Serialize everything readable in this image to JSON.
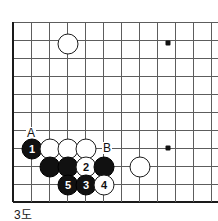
{
  "figure": {
    "caption": "3도",
    "kind": "go-board-diagram"
  },
  "board": {
    "grid": {
      "origin_x": 13,
      "origin_y": 22,
      "spacing": 18,
      "cols": 12,
      "rows": 11,
      "line_color": "#5d5d5d",
      "edge_color": "#1a1a1a",
      "background": "#ffffff"
    },
    "edges": {
      "left": true,
      "bottom": true,
      "top": false,
      "right": false
    },
    "star_points": [
      {
        "name": "star-point-upper-right",
        "x": 168,
        "y": 43
      },
      {
        "name": "star-point-lower-right",
        "x": 168,
        "y": 148
      }
    ],
    "stones": [
      {
        "id": "white-upper-left-approach",
        "color": "white",
        "label": "",
        "x": 67,
        "y": 43
      },
      {
        "id": "black-move-1",
        "color": "black",
        "label": "1",
        "x": 31,
        "y": 148
      },
      {
        "id": "white-a",
        "color": "white",
        "label": "",
        "x": 49,
        "y": 148
      },
      {
        "id": "white-b",
        "color": "white",
        "label": "",
        "x": 67,
        "y": 148
      },
      {
        "id": "white-c",
        "color": "white",
        "label": "",
        "x": 85,
        "y": 148
      },
      {
        "id": "black-d",
        "color": "black",
        "label": "",
        "x": 49,
        "y": 166
      },
      {
        "id": "black-e",
        "color": "black",
        "label": "",
        "x": 67,
        "y": 166
      },
      {
        "id": "white-move-2",
        "color": "white",
        "label": "2",
        "x": 85,
        "y": 166
      },
      {
        "id": "black-f",
        "color": "black",
        "label": "",
        "x": 103,
        "y": 166
      },
      {
        "id": "white-right-side",
        "color": "white",
        "label": "",
        "x": 139,
        "y": 166
      },
      {
        "id": "black-move-5",
        "color": "black",
        "label": "5",
        "x": 67,
        "y": 184
      },
      {
        "id": "black-move-3",
        "color": "black",
        "label": "3",
        "x": 85,
        "y": 184
      },
      {
        "id": "white-move-4",
        "color": "white",
        "label": "4",
        "x": 103,
        "y": 184
      }
    ],
    "point_labels": [
      {
        "id": "point-label-a",
        "text": "A",
        "x": 31,
        "y": 133
      },
      {
        "id": "point-label-b",
        "text": "B",
        "x": 107,
        "y": 148
      }
    ]
  }
}
